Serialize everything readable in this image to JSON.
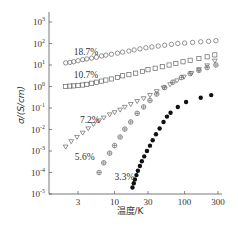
{
  "chart_data": {
    "type": "scatter",
    "title": "",
    "xlabel": "温度/K",
    "ylabel": "σ/(S/cm)",
    "xscale": "log",
    "yscale": "log",
    "xlim": [
      1.8,
      350
    ],
    "ylim": [
      1e-05,
      1000.0
    ],
    "x_ticks": [
      3,
      10,
      30,
      100,
      300
    ],
    "x_tick_labels": [
      "3",
      "10",
      "30",
      "100",
      "300"
    ],
    "y_ticks_exp": [
      3,
      2,
      1,
      0,
      -1,
      -2,
      -3,
      -4,
      -5
    ],
    "grid": false,
    "legend": "inline labels",
    "series": [
      {
        "name": "18.7%",
        "marker": "open-circle",
        "points": [
          [
            2.0,
            1.1
          ],
          [
            2.3,
            1.12
          ],
          [
            2.6,
            1.15
          ],
          [
            3.0,
            1.2
          ],
          [
            3.5,
            1.25
          ],
          [
            4.0,
            1.28
          ],
          [
            4.7,
            1.32
          ],
          [
            5.5,
            1.36
          ],
          [
            6.5,
            1.42
          ],
          [
            7.5,
            1.46
          ],
          [
            9,
            1.5
          ],
          [
            11,
            1.55
          ],
          [
            13,
            1.6
          ],
          [
            16,
            1.65
          ],
          [
            19,
            1.7
          ],
          [
            23,
            1.75
          ],
          [
            28,
            1.8
          ],
          [
            34,
            1.84
          ],
          [
            42,
            1.88
          ],
          [
            52,
            1.92
          ],
          [
            65,
            1.96
          ],
          [
            80,
            2.0
          ],
          [
            100,
            2.02
          ],
          [
            130,
            2.05
          ],
          [
            170,
            2.08
          ],
          [
            220,
            2.1
          ],
          [
            280,
            2.13
          ]
        ]
      },
      {
        "name": "10.7%",
        "marker": "open-square",
        "points": [
          [
            2.0,
            0.0
          ],
          [
            2.3,
            0.02
          ],
          [
            2.6,
            0.03
          ],
          [
            3.0,
            0.05
          ],
          [
            3.5,
            0.07
          ],
          [
            4.0,
            0.1
          ],
          [
            4.7,
            0.15
          ],
          [
            5.5,
            0.2
          ],
          [
            6.5,
            0.25
          ],
          [
            7.5,
            0.3
          ],
          [
            9,
            0.35
          ],
          [
            11,
            0.42
          ],
          [
            13,
            0.5
          ],
          [
            16,
            0.55
          ],
          [
            20,
            0.62
          ],
          [
            25,
            0.7
          ],
          [
            30,
            0.78
          ],
          [
            38,
            0.85
          ],
          [
            48,
            0.92
          ],
          [
            60,
            1.0
          ],
          [
            75,
            1.07
          ],
          [
            95,
            1.15
          ],
          [
            120,
            1.22
          ],
          [
            160,
            1.3
          ],
          [
            210,
            1.38
          ],
          [
            270,
            1.47
          ]
        ]
      },
      {
        "name": "7.2%",
        "marker": "open-triangle-down",
        "points": [
          [
            2.0,
            -2.8
          ],
          [
            2.4,
            -2.55
          ],
          [
            2.9,
            -2.35
          ],
          [
            3.5,
            -2.15
          ],
          [
            4.2,
            -1.95
          ],
          [
            5.0,
            -1.75
          ],
          [
            6.0,
            -1.58
          ],
          [
            7.0,
            -1.45
          ],
          [
            8.5,
            -1.3
          ],
          [
            10,
            -1.2
          ],
          [
            12,
            -1.08
          ],
          [
            14,
            -0.95
          ],
          [
            17,
            -0.82
          ],
          [
            21,
            -0.68
          ],
          [
            26,
            -0.55
          ],
          [
            32,
            -0.4
          ],
          [
            40,
            -0.22
          ],
          [
            50,
            -0.05
          ],
          [
            62,
            0.1
          ],
          [
            78,
            0.28
          ],
          [
            98,
            0.45
          ],
          [
            125,
            0.62
          ],
          [
            160,
            0.8
          ],
          [
            210,
            0.98
          ],
          [
            270,
            1.2
          ]
        ]
      },
      {
        "name": "5.6%",
        "marker": "crossed-circle",
        "points": [
          [
            6,
            -4.0
          ],
          [
            7,
            -3.55
          ],
          [
            8.5,
            -3.1
          ],
          [
            10,
            -2.75
          ],
          [
            12,
            -2.35
          ],
          [
            14,
            -1.98
          ],
          [
            17,
            -1.65
          ],
          [
            21,
            -1.25
          ],
          [
            26,
            -0.95
          ],
          [
            32,
            -0.65
          ],
          [
            40,
            -0.35
          ],
          [
            52,
            -0.05
          ],
          [
            68,
            0.2
          ],
          [
            90,
            0.42
          ],
          [
            120,
            0.6
          ],
          [
            160,
            0.75
          ],
          [
            210,
            0.88
          ],
          [
            280,
            1.0
          ]
        ]
      },
      {
        "name": "3.3%",
        "marker": "filled-circle",
        "points": [
          [
            18,
            -4.7
          ],
          [
            18.8,
            -4.5
          ],
          [
            19.5,
            -4.32
          ],
          [
            20.5,
            -4.12
          ],
          [
            21.5,
            -3.92
          ],
          [
            23,
            -3.7
          ],
          [
            24.5,
            -3.48
          ],
          [
            26.5,
            -3.25
          ],
          [
            29,
            -3.0
          ],
          [
            32,
            -2.75
          ],
          [
            35,
            -2.5
          ],
          [
            39,
            -2.22
          ],
          [
            44,
            -1.95
          ],
          [
            50,
            -1.65
          ],
          [
            56,
            -1.4
          ],
          [
            63,
            -1.22
          ],
          [
            80,
            -0.95
          ],
          [
            105,
            -0.72
          ],
          [
            170,
            -0.52
          ],
          [
            240,
            -0.4
          ]
        ]
      }
    ],
    "annotations": [
      {
        "text": "18.7%",
        "x": 2.6,
        "y": 1.45
      },
      {
        "text": "10.7%",
        "x": 2.6,
        "y": 0.4
      },
      {
        "text": "7.2%",
        "x": 3.2,
        "y": -1.7
      },
      {
        "text": "5.6%",
        "x": 2.7,
        "y": -3.4
      },
      {
        "text": "3.3%",
        "x": 10,
        "y": -4.35
      }
    ]
  },
  "axes": {
    "xlabel": "温度/K",
    "ylabel": "σ/(S/cm)"
  }
}
